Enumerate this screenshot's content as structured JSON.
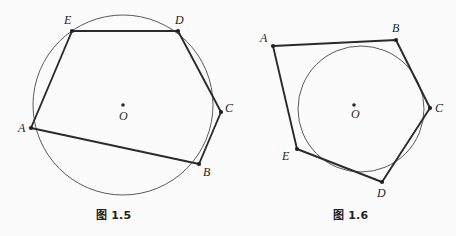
{
  "page": {
    "background_color": "#fbfbfc",
    "ink_color": "#2b2b2b",
    "circle_color": "#555555",
    "width": 456,
    "height": 236
  },
  "figures": [
    {
      "id": "fig-1-5",
      "caption": "图 1.5",
      "description": "cyclic pentagon ABCDE inscribed in circle O",
      "circle": {
        "center_label": "O",
        "cx": 123,
        "cy": 105,
        "r": 90,
        "stroke": "#5a5a5a",
        "stroke_width": 1
      },
      "center_dot": {
        "cx": 123,
        "cy": 105,
        "r": 1.8
      },
      "center_label": {
        "text": "O",
        "x": 120,
        "y": 112
      },
      "polygon_order": [
        "A",
        "B",
        "C",
        "D",
        "E"
      ],
      "vertices": [
        {
          "name": "A",
          "x": 31,
          "y": 128,
          "label_x": 18,
          "label_y": 128
        },
        {
          "name": "B",
          "x": 199,
          "y": 164,
          "label_x": 203,
          "label_y": 172
        },
        {
          "name": "C",
          "x": 221,
          "y": 112,
          "label_x": 225,
          "label_y": 108
        },
        {
          "name": "D",
          "x": 178,
          "y": 31,
          "label_x": 175,
          "label_y": 20
        },
        {
          "name": "E",
          "x": 72,
          "y": 31,
          "label_x": 64,
          "label_y": 20
        }
      ]
    },
    {
      "id": "fig-1-6",
      "caption": "图 1.6",
      "description": "circumscribed pentagon ABCDE about circle O",
      "circle": {
        "center_label": "O",
        "cx": 361,
        "cy": 109,
        "r": 63,
        "stroke": "#5a5a5a",
        "stroke_width": 1
      },
      "center_dot": {
        "cx": 354,
        "cy": 105,
        "r": 1.8
      },
      "center_label": {
        "text": "O",
        "x": 352,
        "y": 113
      },
      "polygon_order": [
        "A",
        "B",
        "C",
        "D",
        "E"
      ],
      "vertices": [
        {
          "name": "A",
          "x": 273,
          "y": 46,
          "label_x": 261,
          "label_y": 39
        },
        {
          "name": "B",
          "x": 396,
          "y": 40,
          "label_x": 392,
          "label_y": 28
        },
        {
          "name": "C",
          "x": 430,
          "y": 108,
          "label_x": 435,
          "label_y": 108
        },
        {
          "name": "D",
          "x": 382,
          "y": 182,
          "label_x": 378,
          "label_y": 193
        },
        {
          "name": "E",
          "x": 297,
          "y": 149,
          "label_x": 283,
          "label_y": 156
        }
      ]
    }
  ]
}
